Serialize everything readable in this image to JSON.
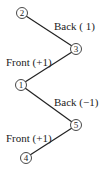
{
  "diagram": {
    "nodes": [
      {
        "id": "2",
        "label": "2",
        "x": 22,
        "y": 13
      },
      {
        "id": "3",
        "label": "3",
        "x": 76,
        "y": 49
      },
      {
        "id": "1",
        "label": "1",
        "x": 21,
        "y": 85
      },
      {
        "id": "5",
        "label": "5",
        "x": 76,
        "y": 125
      },
      {
        "id": "4",
        "label": "4",
        "x": 26,
        "y": 158
      }
    ],
    "edges": [
      {
        "from": "2",
        "to": "3",
        "label": "Back ( 1)"
      },
      {
        "from": "3",
        "to": "1",
        "label": "Front (+1)"
      },
      {
        "from": "1",
        "to": "5",
        "label": "Back (−1)"
      },
      {
        "from": "5",
        "to": "4",
        "label": "Front (+1)"
      }
    ]
  }
}
